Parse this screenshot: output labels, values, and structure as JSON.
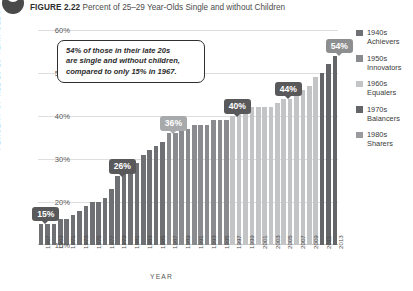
{
  "figure": {
    "icon": "circle-badge-icon",
    "label": "FIGURE 2.22",
    "caption": "Percent of 25–29 Year-Olds Single and without Children"
  },
  "callout": {
    "line1": "54% of those in their late 20s",
    "line2": "are single and without children,",
    "line3": "compared to only 15% in 1967."
  },
  "legend": {
    "items": [
      {
        "decade": "1940s",
        "name": "Achievers",
        "color": "#6f7073"
      },
      {
        "decade": "1950s",
        "name": "Innovators",
        "color": "#8a8b8e"
      },
      {
        "decade": "1960s",
        "name": "Equalers",
        "color": "#c3c4c6"
      },
      {
        "decade": "1970s",
        "name": "Balancers",
        "color": "#646568"
      },
      {
        "decade": "1980s",
        "name": "Sharers",
        "color": "#9a9b9e"
      }
    ]
  },
  "badges": [
    {
      "text": "15%",
      "year": 1967,
      "tone": "dark"
    },
    {
      "text": "26%",
      "year": 1979,
      "tone": "dark"
    },
    {
      "text": "36%",
      "year": 1987,
      "tone": "light"
    },
    {
      "text": "40%",
      "year": 1997,
      "tone": "dark"
    },
    {
      "text": "44%",
      "year": 2005,
      "tone": "dark"
    },
    {
      "text": "54%",
      "year": 2013,
      "tone": "mid"
    }
  ],
  "chart_data": {
    "type": "bar",
    "title": "Percent of 25–29 Year-Olds Single and without Children",
    "xlabel": "YEAR",
    "ylabel": "PERCENT OF ALL 25-29 YEAR OLDS",
    "ylim": [
      10,
      60
    ],
    "yticks": [
      "10%",
      "20%",
      "30%",
      "40%",
      "50%",
      "60%"
    ],
    "ytick_values": [
      10,
      20,
      30,
      40,
      50,
      60
    ],
    "grid": true,
    "legend_position": "right",
    "xtick_labels": [
      "1967",
      "1969",
      "1971",
      "1973",
      "1975",
      "1977",
      "1979",
      "1981",
      "1983",
      "1985",
      "1987",
      "1989",
      "1991",
      "1993",
      "1995",
      "1997",
      "1999",
      "2001",
      "2003",
      "2005",
      "2007",
      "2009",
      "2011",
      "2013"
    ],
    "categories": [
      1967,
      1968,
      1969,
      1970,
      1971,
      1972,
      1973,
      1974,
      1975,
      1976,
      1977,
      1978,
      1979,
      1980,
      1981,
      1982,
      1983,
      1984,
      1985,
      1986,
      1987,
      1988,
      1989,
      1990,
      1991,
      1992,
      1993,
      1994,
      1995,
      1996,
      1997,
      1998,
      1999,
      2000,
      2001,
      2002,
      2003,
      2004,
      2005,
      2006,
      2007,
      2008,
      2009,
      2010,
      2011,
      2012,
      2013
    ],
    "values": [
      15,
      15,
      15,
      16,
      16,
      17,
      18,
      19,
      20,
      20,
      21,
      23,
      26,
      27,
      28,
      29,
      31,
      32,
      33,
      34,
      36,
      36,
      37,
      37,
      38,
      38,
      38,
      39,
      39,
      39,
      40,
      41,
      41,
      42,
      42,
      42,
      42,
      43,
      44,
      44,
      45,
      46,
      47,
      49,
      50,
      52,
      54
    ],
    "bar_groups": [
      {
        "name": "1940s Achievers",
        "color": "#6f7073",
        "start": 1967,
        "end": 1986
      },
      {
        "name": "1950s Innovators",
        "color": "#8a8b8e",
        "start": 1987,
        "end": 1996
      },
      {
        "name": "1960s Equalers",
        "color": "#c3c4c6",
        "start": 1997,
        "end": 2010
      },
      {
        "name": "1970s Balancers",
        "color": "#646568",
        "start": 2011,
        "end": 2013
      }
    ]
  }
}
